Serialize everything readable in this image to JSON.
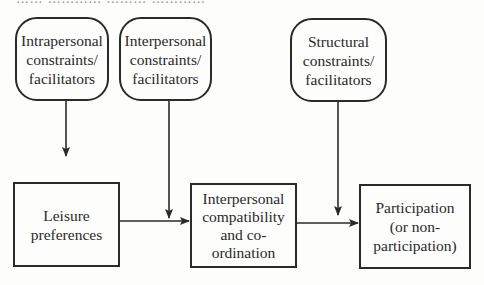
{
  "header": {
    "cutoff_text": "…… ………… ……… …………"
  },
  "diagram": {
    "factors": [
      {
        "id": "intrapersonal",
        "label": "Intrapersonal\nconstraints/\nfacilitators"
      },
      {
        "id": "interpersonal",
        "label": "Interpersonal\nconstraints/\nfacilitators"
      },
      {
        "id": "structural",
        "label": "Structural\nconstraints/\nfacilitators"
      }
    ],
    "stages": [
      {
        "id": "leisure",
        "label": "Leisure\npreferences"
      },
      {
        "id": "compatibility",
        "label": "Interpersonal\ncompatibility\nand co-\nordination"
      },
      {
        "id": "participation",
        "label": "Participation\n(or non-\nparticipation)"
      }
    ],
    "edges": [
      {
        "from": "intrapersonal",
        "to": "leisure"
      },
      {
        "from": "leisure",
        "to": "compatibility"
      },
      {
        "from": "interpersonal",
        "to": "leisure→compatibility"
      },
      {
        "from": "compatibility",
        "to": "participation"
      },
      {
        "from": "structural",
        "to": "compatibility→participation"
      }
    ],
    "colors": {
      "stroke": "#2a2a2a",
      "background": "#fdfdfc"
    }
  }
}
